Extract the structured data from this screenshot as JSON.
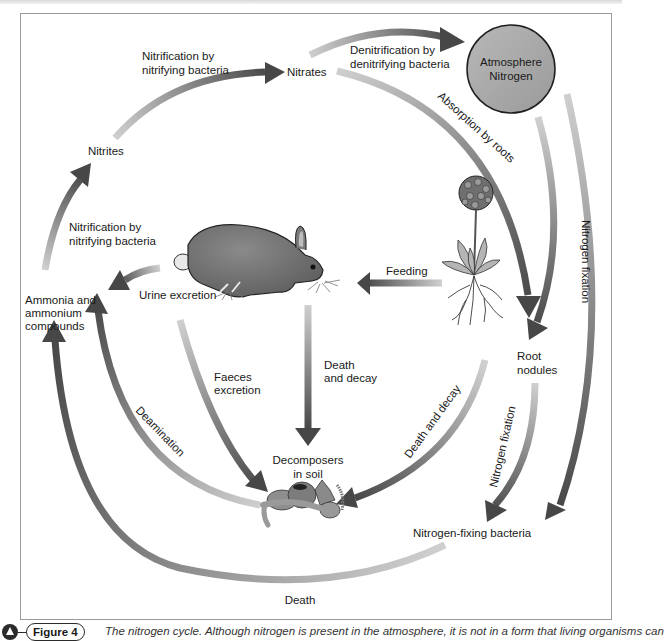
{
  "figure": {
    "number_label": "Figure 4",
    "caption": "The nitrogen cycle. Although nitrogen is present in the atmosphere, it is not in a form that living organisms can",
    "caption_line2_partial": "use. In the soil there are many ... which nitrogen is converted into nitrates. Th... are ..."
  },
  "colors": {
    "arrow_dark": "#4a4a4a",
    "arrow_light": "#c8c8c8",
    "atmosphere_fill": "#a8a8a8",
    "rabbit": "#7a7a7a",
    "frame": "#9a9a9a"
  },
  "nodes": {
    "atmosphere": "Atmosphere",
    "atmosphere_2": "Nitrogen",
    "nitrates": "Nitrates",
    "nitrites": "Nitrites",
    "ammonia_1": "Ammonia and",
    "ammonia_2": "ammonium",
    "ammonia_3": "compounds",
    "root_nodules_1": "Root",
    "root_nodules_2": "nodules",
    "decomposers_1": "Decomposers",
    "decomposers_2": "in soil",
    "nitrogen_fixing_bacteria": "Nitrogen-fixing bacteria"
  },
  "processes": {
    "nitrification_top_1": "Nitrification by",
    "nitrification_top_2": "nitrifying bacteria",
    "nitrification_left_1": "Nitrification by",
    "nitrification_left_2": "nitrifying bacteria",
    "denitrification_1": "Denitrification by",
    "denitrification_2": "denitrifying bacteria",
    "absorption": "Absorption by roots",
    "nitrogen_fixation_outer": "Nitrogen fixation",
    "nitrogen_fixation_inner": "Nitrogen fixation",
    "feeding": "Feeding",
    "urine": "Urine excretion",
    "faeces_1": "Faeces",
    "faeces_2": "excretion",
    "death_decay_animal_1": "Death",
    "death_decay_animal_2": "and decay",
    "death_decay_plant": "Death and decay",
    "deamination": "Deamination",
    "death": "Death"
  }
}
